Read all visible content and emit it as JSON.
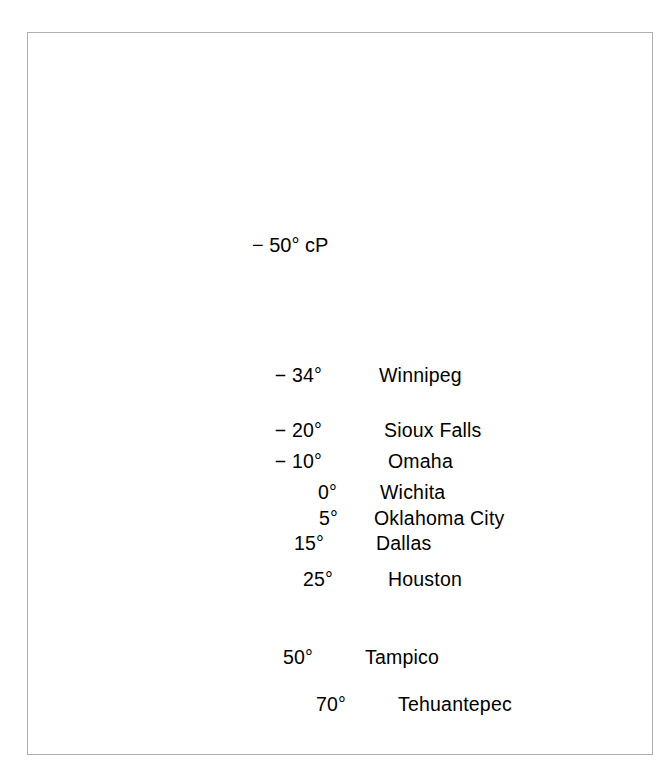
{
  "figure": {
    "type": "map",
    "region": "North America",
    "frame": {
      "border_color": "#b0b0b0"
    },
    "colors": {
      "land_fill": "#c8c8c8",
      "land_stroke": "#8a8a8a",
      "water_fill": "#ffffff",
      "ink": "#000000",
      "frame": "#b0b0b0"
    }
  },
  "airmass": {
    "source_label": "− 50°  cP",
    "source_temperature": "− 50°",
    "source_code": "cP"
  },
  "front_line": {
    "name": "polar-front-line",
    "description": "Heavy black line arcing from the Pacific coast across southern Canada through the Great Lakes to the Atlantic coast"
  },
  "arrows": [
    {
      "name": "arrow-arctic-to-winnipeg",
      "from": [
        274,
        283
      ],
      "to": [
        297,
        364
      ]
    },
    {
      "name": "arrow-winnipeg-to-dallas",
      "from": [
        293,
        415
      ],
      "to": [
        303,
        529
      ]
    },
    {
      "name": "arrow-houston-to-tampico",
      "from": [
        306,
        548
      ],
      "to": [
        319,
        609
      ]
    },
    {
      "name": "arrow-tampico-to-tehuantepec",
      "from": [
        325,
        648
      ],
      "to": [
        349,
        682
      ]
    }
  ],
  "stations": [
    {
      "temp": "− 34°",
      "city": "Winnipeg",
      "temp_x": 322,
      "temp_y": 366,
      "dot_x": 370,
      "dot_y": 378,
      "city_x": 379,
      "city_y": 366
    },
    {
      "temp": "− 20°",
      "city": "Sioux Falls",
      "temp_x": 322,
      "temp_y": 421,
      "dot_x": 375,
      "dot_y": 433,
      "city_x": 384,
      "city_y": 421
    },
    {
      "temp": "− 10°",
      "city": "Omaha",
      "temp_x": 322,
      "temp_y": 452,
      "dot_x": 379,
      "dot_y": 464,
      "city_x": 388,
      "city_y": 452
    },
    {
      "temp": "0°",
      "city": "Wichita",
      "temp_x": 337,
      "temp_y": 483,
      "dot_x": 371,
      "dot_y": 495,
      "city_x": 380,
      "city_y": 483
    },
    {
      "temp": "5°",
      "city": "Oklahoma City",
      "temp_x": 338,
      "temp_y": 509,
      "dot_x": 365,
      "dot_y": 521,
      "city_x": 374,
      "city_y": 509
    },
    {
      "temp": "15°",
      "city": "Dallas",
      "temp_x": 324,
      "temp_y": 534,
      "dot_x": 366,
      "dot_y": 540,
      "city_x": 376,
      "city_y": 534
    },
    {
      "temp": "25°",
      "city": "Houston",
      "temp_x": 333,
      "temp_y": 570,
      "dot_x": 375,
      "dot_y": 564,
      "city_x": 388,
      "city_y": 570
    },
    {
      "temp": "50°",
      "city": "Tampico",
      "temp_x": 313,
      "temp_y": 648,
      "dot_x": 356,
      "dot_y": 660,
      "city_x": 365,
      "city_y": 648
    },
    {
      "temp": "70°",
      "city": "Tehuantepec",
      "temp_x": 346,
      "temp_y": 695,
      "dot_x": 389,
      "dot_y": 707,
      "city_x": 398,
      "city_y": 695
    }
  ],
  "chart_data": {
    "type": "line",
    "xlabel": "Station along trajectory",
    "ylabel": "Air temperature (°F)",
    "categories": [
      "Source region (cP)",
      "Winnipeg",
      "Sioux Falls",
      "Omaha",
      "Wichita",
      "Oklahoma City",
      "Dallas",
      "Houston",
      "Tampico",
      "Tehuantepec"
    ],
    "values": [
      -50,
      -34,
      -20,
      -10,
      0,
      5,
      15,
      25,
      50,
      70
    ],
    "ylim": [
      -60,
      80
    ],
    "grid": false,
    "legend": "none"
  }
}
